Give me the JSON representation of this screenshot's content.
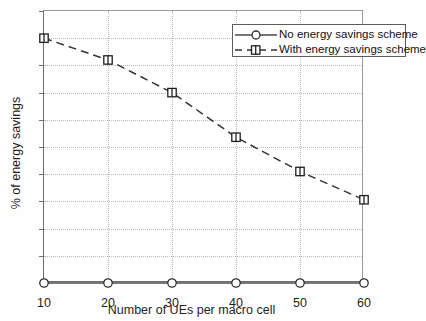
{
  "chart_data": {
    "type": "line",
    "title": "",
    "xlabel": "Number of UEs per macro cell",
    "ylabel": "% of energy savings",
    "x": [
      10,
      20,
      30,
      40,
      50,
      60
    ],
    "xlim": [
      10,
      60
    ],
    "ylim": [
      0,
      50
    ],
    "xticks": [
      "10",
      "20",
      "30",
      "40",
      "50",
      "60"
    ],
    "yticks": [
      "0",
      "5",
      "10",
      "15",
      "20",
      "25",
      "30",
      "35",
      "40",
      "45",
      "50"
    ],
    "grid": true,
    "legend_position": "top-right",
    "series": [
      {
        "name": "No energy savings scheme",
        "values": [
          0,
          0,
          0,
          0,
          0,
          0
        ],
        "linestyle": "solid",
        "marker": "circle",
        "color": "#4a4a4a"
      },
      {
        "name": "With energy savings scheme",
        "values": [
          45,
          41,
          35,
          26.8,
          20.5,
          15.3
        ],
        "linestyle": "dashed",
        "marker": "square",
        "color": "#333333"
      }
    ]
  },
  "axes": {
    "x_title": "Number of UEs per macro cell",
    "y_title": "% of energy savings",
    "x_tick_labels": [
      "10",
      "20",
      "30",
      "40",
      "50",
      "60"
    ],
    "y_tick_labels": [
      "0",
      "5",
      "10",
      "15",
      "20",
      "25",
      "30",
      "35",
      "40",
      "45",
      "50"
    ]
  },
  "legend": {
    "entries": [
      {
        "label": "No energy savings scheme",
        "marker": "circle-marker",
        "line": "solid-line"
      },
      {
        "label": "With energy savings scheme",
        "marker": "square-marker",
        "line": "dashed-line"
      }
    ]
  },
  "colors": {
    "axis": "#6d6d6d",
    "grid": "#b9b9b9",
    "series_no_scheme": "#4a4a4a",
    "series_with_scheme": "#333333",
    "background": "#ffffff"
  }
}
